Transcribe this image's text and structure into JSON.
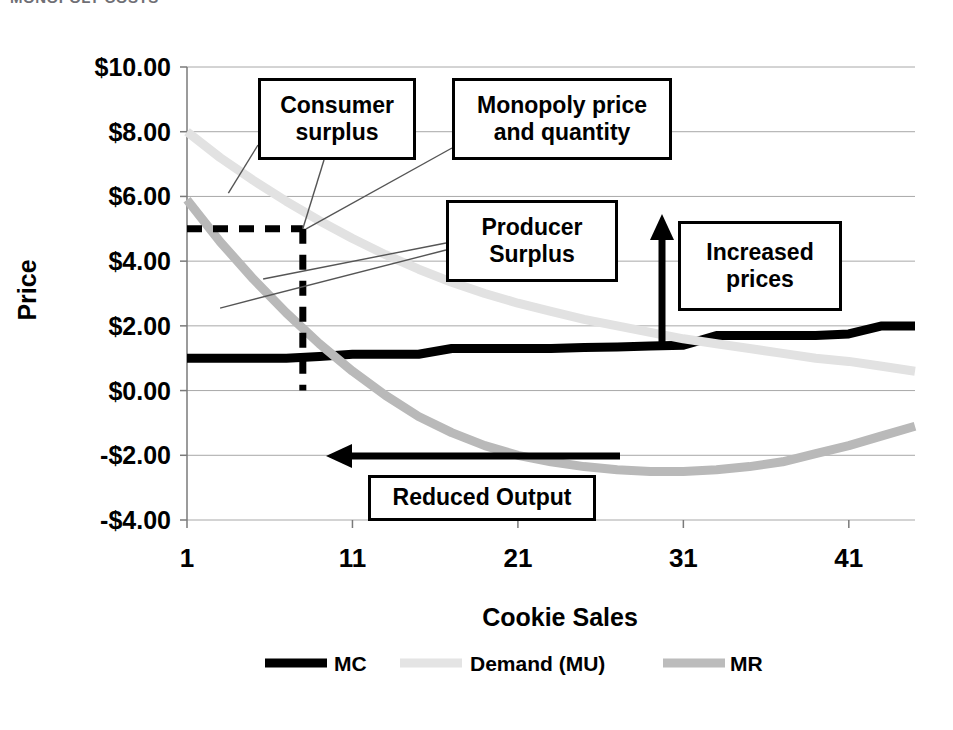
{
  "page": {
    "cut_off_header": "MONOPOLY COSTS"
  },
  "chart_data": {
    "type": "line",
    "title": "",
    "xlabel": "Cookie Sales",
    "ylabel": "Price",
    "xlim": [
      1,
      45
    ],
    "ylim": [
      -4,
      10
    ],
    "grid": true,
    "legend_position": "bottom",
    "xticks": [
      "1",
      "11",
      "21",
      "31",
      "41"
    ],
    "xtick_values": [
      1,
      11,
      21,
      31,
      41
    ],
    "yticks": [
      "$10.00",
      "$8.00",
      "$6.00",
      "$4.00",
      "$2.00",
      "$0.00",
      "-$2.00",
      "-$4.00"
    ],
    "ytick_values": [
      10,
      8,
      6,
      4,
      2,
      0,
      -2,
      -4
    ],
    "x": [
      1,
      3,
      5,
      7,
      9,
      11,
      13,
      15,
      17,
      19,
      21,
      23,
      25,
      27,
      29,
      31,
      33,
      35,
      37,
      39,
      41,
      43,
      45
    ],
    "series": [
      {
        "name": "MC",
        "color": "#000000",
        "width": 9,
        "values": [
          1.0,
          1.0,
          1.0,
          1.0,
          1.05,
          1.12,
          1.12,
          1.12,
          1.3,
          1.3,
          1.3,
          1.3,
          1.33,
          1.35,
          1.38,
          1.4,
          1.7,
          1.7,
          1.7,
          1.7,
          1.75,
          2.0,
          2.0
        ]
      },
      {
        "name": "Demand (MU)",
        "color": "#e2e2e2",
        "width": 9,
        "values": [
          8.0,
          7.2,
          6.5,
          5.85,
          5.25,
          4.7,
          4.2,
          3.75,
          3.35,
          3.0,
          2.7,
          2.45,
          2.2,
          2.0,
          1.8,
          1.6,
          1.45,
          1.3,
          1.15,
          1.0,
          0.9,
          0.75,
          0.6
        ]
      },
      {
        "name": "MR",
        "color": "#b9b9b9",
        "width": 9,
        "values": [
          5.9,
          4.6,
          3.45,
          2.4,
          1.45,
          0.6,
          -0.15,
          -0.8,
          -1.3,
          -1.7,
          -2.0,
          -2.2,
          -2.35,
          -2.45,
          -2.5,
          -2.5,
          -2.45,
          -2.35,
          -2.2,
          -1.95,
          -1.7,
          -1.4,
          -1.1
        ]
      }
    ],
    "legend": [
      {
        "label": "MC",
        "color": "#000000",
        "style": "solid-thick"
      },
      {
        "label": "Demand (MU)",
        "color": "#e4e4e4",
        "style": "solid-thick"
      },
      {
        "label": "MR",
        "color": "#bcbcbc",
        "style": "solid-thick"
      }
    ],
    "reference_lines": [
      {
        "name": "monopoly-price-line",
        "orientation": "horizontal",
        "value": 5.0,
        "from_x": 1,
        "to_x": 8,
        "style": "dashed"
      },
      {
        "name": "monopoly-quantity-line",
        "orientation": "vertical",
        "value": 8,
        "from_y": 5.0,
        "to_y": 0.0,
        "style": "dashed"
      }
    ],
    "annotations": [
      {
        "name": "consumer-surplus",
        "lines": [
          "Consumer",
          "surplus"
        ],
        "leader_to": [
          3.5,
          6.1
        ]
      },
      {
        "name": "monopoly-price-and-quantity",
        "lines": [
          "Monopoly price",
          "and quantity"
        ],
        "leader_to": [
          8.0,
          5.0
        ]
      },
      {
        "name": "producer-surplus",
        "lines": [
          "Producer",
          "Surplus"
        ],
        "leader_to": [
          3.0,
          3.1
        ]
      },
      {
        "name": "increased-prices",
        "lines": [
          "Increased",
          "prices"
        ],
        "arrow": "up"
      },
      {
        "name": "reduced-output",
        "lines": [
          "Reduced  Output"
        ],
        "arrow": "left"
      }
    ]
  }
}
